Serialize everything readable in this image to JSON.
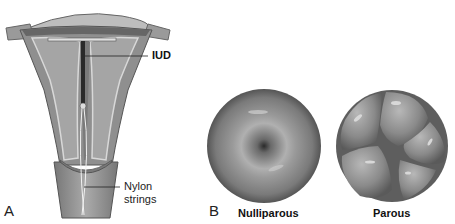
{
  "panels": [
    {
      "letter": "A",
      "subject": "uterus with intrauterine device",
      "callouts": [
        {
          "label": "IUD",
          "bold": true
        },
        {
          "label_line1": "Nylon",
          "label_line2": "strings",
          "bold": false
        }
      ]
    },
    {
      "letter": "B",
      "subject": "cervical os views",
      "items": [
        {
          "label": "Nulliparous"
        },
        {
          "label": "Parous"
        }
      ]
    }
  ],
  "colors": {
    "tissue_outer": "#8a8a8a",
    "tissue_inner": "#a8a8a8",
    "tissue_light": "#d0d0d0",
    "iud": "#2a2a2a",
    "cervix_dark": "#5a5a5a",
    "cervix_mid": "#9a9a9a"
  }
}
